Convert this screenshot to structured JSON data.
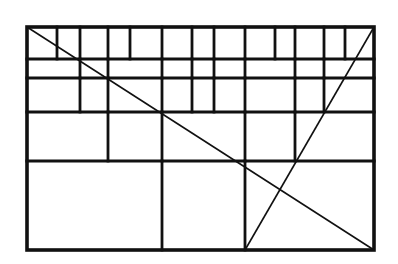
{
  "diagram": {
    "type": "grid-subdivision-with-diagonals",
    "stroke_color": "#111111",
    "background": "#ffffff",
    "frame": {
      "x1": 27,
      "y1": 27,
      "x2": 374,
      "y2": 250
    },
    "horizontal_lines": [
      59,
      78,
      112,
      161
    ],
    "rows": [
      {
        "name": "row-1",
        "y1": 27,
        "y2": 59,
        "verticals": [
          57,
          80,
          108,
          130,
          162,
          192,
          214,
          245,
          275,
          295,
          324,
          345
        ]
      },
      {
        "name": "row-2",
        "y1": 59,
        "y2": 78,
        "verticals": [
          80,
          108,
          162,
          192,
          214,
          245,
          295,
          324
        ]
      },
      {
        "name": "row-3",
        "y1": 78,
        "y2": 112,
        "verticals": [
          80,
          108,
          162,
          192,
          214,
          245,
          295,
          324
        ]
      },
      {
        "name": "row-4",
        "y1": 112,
        "y2": 161,
        "verticals": [
          108,
          162,
          245,
          295
        ]
      },
      {
        "name": "row-5",
        "y1": 161,
        "y2": 250,
        "verticals": [
          162,
          245
        ]
      }
    ],
    "diagonals": [
      {
        "name": "main-diagonal",
        "x1": 27,
        "y1": 27,
        "x2": 374,
        "y2": 250
      },
      {
        "name": "secondary-diagonal",
        "x1": 374,
        "y1": 27,
        "x2": 245,
        "y2": 250
      }
    ]
  }
}
